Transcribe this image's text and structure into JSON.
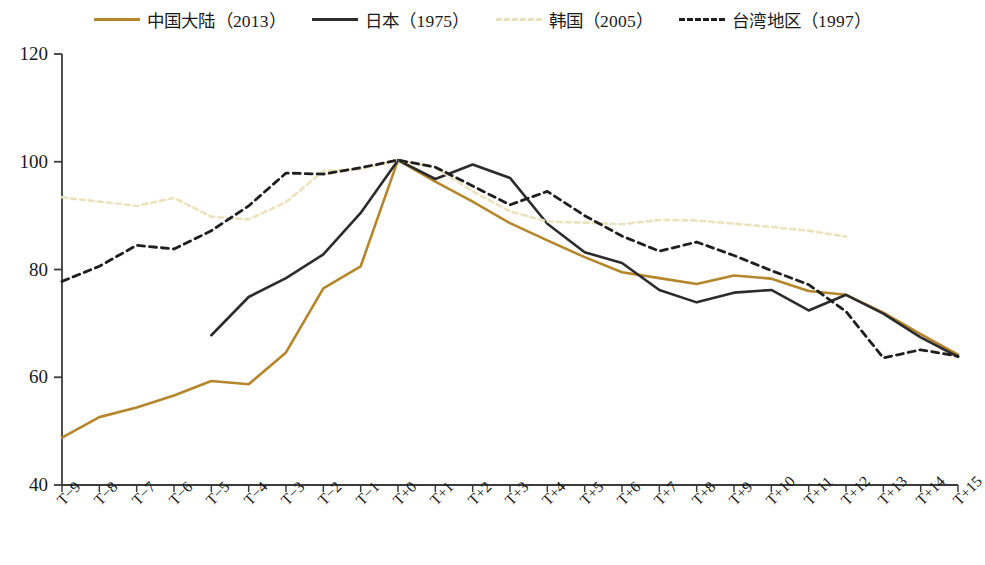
{
  "chart_data": {
    "type": "line",
    "title": "",
    "xlabel": "",
    "ylabel": "",
    "x": [
      "T-9",
      "T-8",
      "T-7",
      "T-6",
      "T-5",
      "T-4",
      "T-3",
      "T-2",
      "T-1",
      "T+0",
      "T+1",
      "T+2",
      "T+3",
      "T+4",
      "T+5",
      "T+6",
      "T+7",
      "T+8",
      "T+9",
      "T+10",
      "T+11",
      "T+12",
      "T+13",
      "T+14",
      "T+15"
    ],
    "xlim": [
      0,
      24
    ],
    "ylim": [
      40,
      120
    ],
    "yticks": [
      40,
      60,
      80,
      100,
      120
    ],
    "grid": false,
    "legend_position": "top",
    "series": [
      {
        "name": "中国大陆（2013）",
        "key": "china",
        "color": "#b5862b",
        "style": "solid",
        "width": 2.6,
        "values": [
          48.8,
          52.6,
          54.4,
          56.6,
          59.3,
          58.7,
          64.6,
          76.5,
          80.6,
          100.3,
          96.3,
          92.6,
          88.6,
          85.4,
          82.3,
          79.5,
          78.4,
          77.3,
          78.9,
          78.3,
          76.0,
          75.3,
          72.0,
          68.0,
          64.2
        ]
      },
      {
        "name": "日本（1975）",
        "key": "japan",
        "color": "#2c2c2c",
        "style": "solid",
        "width": 2.6,
        "values": [
          null,
          null,
          null,
          null,
          67.8,
          74.9,
          78.4,
          82.8,
          90.5,
          100.3,
          96.8,
          99.5,
          97.0,
          88.5,
          83.2,
          81.2,
          76.2,
          73.9,
          75.7,
          76.2,
          72.4,
          75.3,
          71.8,
          67.4,
          63.8
        ]
      },
      {
        "name": "韩国（2005）",
        "key": "korea",
        "color": "#ece2bd",
        "style": "dashed",
        "width": 2.6,
        "values": [
          93.4,
          92.6,
          91.8,
          93.3,
          89.8,
          89.3,
          92.5,
          98.3,
          98.6,
          100.3,
          98.9,
          94.5,
          90.8,
          88.9,
          88.7,
          88.4,
          89.2,
          89.1,
          88.5,
          87.9,
          87.2,
          86.1,
          null,
          null,
          null
        ]
      },
      {
        "name": "台湾地区（1997）",
        "key": "taiwan",
        "color": "#1f1f1f",
        "style": "dashed",
        "width": 2.8,
        "values": [
          77.8,
          80.6,
          84.5,
          83.8,
          87.2,
          91.8,
          97.9,
          97.7,
          98.9,
          100.3,
          99.0,
          95.5,
          92.0,
          94.5,
          90.0,
          86.2,
          83.4,
          85.1,
          82.6,
          79.8,
          77.2,
          72.2,
          63.6,
          65.1,
          63.9
        ]
      }
    ]
  },
  "legend": {
    "items": [
      {
        "label": "中国大陆（2013）",
        "color": "#b5862b",
        "style": "solid",
        "name": "legend-china"
      },
      {
        "label": "日本（1975）",
        "color": "#2c2c2c",
        "style": "solid",
        "name": "legend-japan"
      },
      {
        "label": "韩国（2005）",
        "color": "#ece2bd",
        "style": "dashed",
        "name": "legend-korea"
      },
      {
        "label": "台湾地区（1997）",
        "color": "#1f1f1f",
        "style": "dashed",
        "name": "legend-taiwan"
      }
    ]
  },
  "axis": {
    "y_ticks": [
      "120",
      "100",
      "80",
      "60",
      "40"
    ],
    "x_ticks": [
      "T-9",
      "T-8",
      "T-7",
      "T-6",
      "T-5",
      "T-4",
      "T-3",
      "T-2",
      "T-1",
      "T+0",
      "T+1",
      "T+2",
      "T+3",
      "T+4",
      "T+5",
      "T+6",
      "T+7",
      "T+8",
      "T+9",
      "T+10",
      "T+11",
      "T+12",
      "T+13",
      "T+14",
      "T+15"
    ]
  },
  "colors": {
    "china": "#b5862b",
    "japan": "#2c2c2c",
    "korea": "#ece2bd",
    "taiwan": "#1f1f1f",
    "axis": "#3b3b3b",
    "background": "#ffffff"
  }
}
